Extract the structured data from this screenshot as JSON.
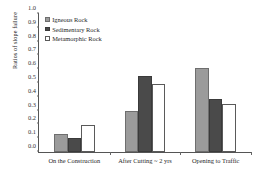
{
  "chart_data": {
    "type": "bar",
    "title": "",
    "xlabel": "",
    "ylabel": "Ratios of slope failure",
    "ylim": [
      0.0,
      1.0
    ],
    "ytick_labels": [
      "0.0",
      "0.1",
      "0.2",
      "0.3",
      "0.4",
      "0.5",
      "0.6",
      "0.7",
      "0.8",
      "0.9",
      "1.0"
    ],
    "ytick_values": [
      0.0,
      0.1,
      0.2,
      0.3,
      0.4,
      0.5,
      0.6,
      0.7,
      0.8,
      0.9,
      1.0
    ],
    "grid": false,
    "legend_position": "upper left",
    "categories": [
      "On the Construction",
      "After Cutting ~ 2 yrs",
      "Opening to Traffic"
    ],
    "series": [
      {
        "name": "Igneous Rock",
        "color": "#9b9b9b",
        "values": [
          0.13,
          0.295,
          0.61
        ]
      },
      {
        "name": "Sedimentary Rock",
        "color": "#4a4a4a",
        "values": [
          0.1,
          0.55,
          0.385
        ]
      },
      {
        "name": "Metamorphic Rock",
        "color": "#ffffff",
        "values": [
          0.195,
          0.49,
          0.345
        ]
      }
    ]
  }
}
